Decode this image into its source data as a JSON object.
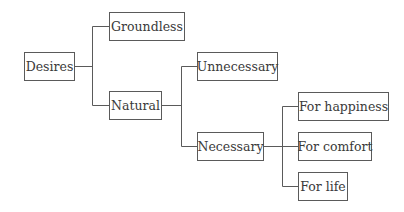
{
  "diagram": {
    "type": "tree",
    "nodes": {
      "desires": "Desires",
      "groundless": "Groundless",
      "natural": "Natural",
      "unnecessary": "Unnecessary",
      "necessary": "Necessary",
      "for_happiness": "For happiness",
      "for_comfort": "For comfort",
      "for_life": "For life"
    },
    "edges": [
      [
        "Desires",
        "Groundless"
      ],
      [
        "Desires",
        "Natural"
      ],
      [
        "Natural",
        "Unnecessary"
      ],
      [
        "Natural",
        "Necessary"
      ],
      [
        "Necessary",
        "For happiness"
      ],
      [
        "Necessary",
        "For comfort"
      ],
      [
        "Necessary",
        "For life"
      ]
    ],
    "colors": {
      "line": "#5a5a5a",
      "text": "#3a3a3a",
      "background": "#ffffff"
    }
  }
}
